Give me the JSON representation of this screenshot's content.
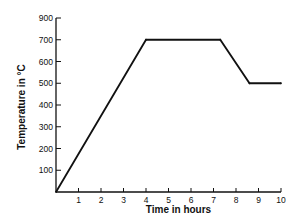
{
  "chart_data": {
    "type": "line",
    "title": "",
    "xlabel": "Time in hours",
    "ylabel": "Temperature in °C",
    "xlim": [
      0,
      10
    ],
    "ylim": [
      0,
      800
    ],
    "grid": false,
    "legend": "none",
    "x_ticks": [
      {
        "value": 1,
        "label": "1"
      },
      {
        "value": 2,
        "label": "2"
      },
      {
        "value": 3,
        "label": "3"
      },
      {
        "value": 4,
        "label": "4"
      },
      {
        "value": 5,
        "label": "5"
      },
      {
        "value": 6,
        "label": "6"
      },
      {
        "value": 7,
        "label": "7"
      },
      {
        "value": 8,
        "label": "8"
      },
      {
        "value": 9,
        "label": "9"
      },
      {
        "value": 10,
        "label": "10"
      }
    ],
    "y_ticks": [
      {
        "value": 100,
        "label": "100"
      },
      {
        "value": 200,
        "label": "200"
      },
      {
        "value": 300,
        "label": "300"
      },
      {
        "value": 400,
        "label": "400"
      },
      {
        "value": 500,
        "label": "500"
      },
      {
        "value": 600,
        "label": "600"
      },
      {
        "value": 700,
        "label": "700"
      },
      {
        "value": 800,
        "label": "900"
      }
    ],
    "series": [
      {
        "name": "Temperature profile",
        "x": [
          0,
          4,
          7.3,
          8.6,
          10
        ],
        "y": [
          0,
          700,
          700,
          500,
          500
        ],
        "color": "#111111"
      }
    ]
  }
}
